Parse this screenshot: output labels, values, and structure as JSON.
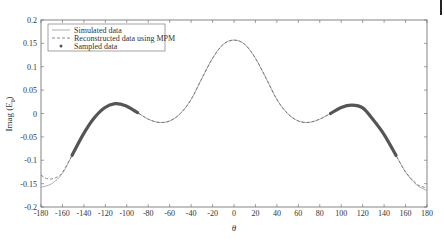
{
  "chart_data": {
    "type": "line",
    "title": "",
    "xlabel": "θ",
    "ylabel": "Imag (E_θ)",
    "xlim": [
      -180,
      180
    ],
    "ylim": [
      -0.2,
      0.2
    ],
    "xticks": [
      -180,
      -160,
      -140,
      -120,
      -100,
      -80,
      -60,
      -40,
      -20,
      0,
      20,
      40,
      60,
      80,
      100,
      120,
      140,
      160,
      180
    ],
    "yticks": [
      -0.2,
      -0.15,
      -0.1,
      -0.05,
      0,
      0.05,
      0.1,
      0.15,
      0.2
    ],
    "ytick_labels": [
      "-0.2",
      "-0.15",
      "-0.1",
      "-0.05",
      "0",
      "0.05",
      "0.1",
      "0.15",
      "0.2"
    ],
    "grid": false,
    "legend_position": "upper left",
    "series": [
      {
        "name": "Simulated data",
        "style": "solid",
        "x": [
          -180,
          -170,
          -160,
          -150,
          -140,
          -130,
          -120,
          -110,
          -100,
          -90,
          -80,
          -70,
          -60,
          -50,
          -40,
          -30,
          -20,
          -10,
          0,
          10,
          20,
          30,
          40,
          50,
          60,
          70,
          80,
          90,
          100,
          110,
          120,
          130,
          140,
          150,
          160,
          170,
          180
        ],
        "y": [
          -0.158,
          -0.15,
          -0.128,
          -0.085,
          -0.042,
          -0.008,
          0.014,
          0.022,
          0.016,
          0.002,
          -0.012,
          -0.019,
          -0.016,
          0.0,
          0.03,
          0.075,
          0.118,
          0.148,
          0.157,
          0.148,
          0.118,
          0.075,
          0.03,
          0.0,
          -0.016,
          -0.019,
          -0.012,
          0.0,
          0.013,
          0.018,
          0.012,
          -0.014,
          -0.045,
          -0.085,
          -0.125,
          -0.152,
          -0.165
        ]
      },
      {
        "name": "Reconstructed data using MPM",
        "style": "dashed",
        "x": [
          -180,
          -175,
          -170,
          -165,
          -160,
          -150,
          -140,
          -130,
          -120,
          -110,
          -100,
          -90,
          -80,
          -70,
          -60,
          -50,
          -40,
          -30,
          -20,
          -10,
          0,
          10,
          20,
          30,
          40,
          50,
          60,
          70,
          80,
          90,
          100,
          110,
          120,
          130,
          140,
          150,
          160,
          170,
          175,
          180
        ],
        "y": [
          -0.132,
          -0.139,
          -0.14,
          -0.136,
          -0.126,
          -0.085,
          -0.042,
          -0.008,
          0.014,
          0.022,
          0.016,
          0.002,
          -0.012,
          -0.019,
          -0.016,
          0.0,
          0.03,
          0.075,
          0.118,
          0.148,
          0.157,
          0.148,
          0.118,
          0.075,
          0.03,
          0.0,
          -0.016,
          -0.019,
          -0.012,
          0.0,
          0.013,
          0.018,
          0.012,
          -0.014,
          -0.045,
          -0.085,
          -0.125,
          -0.15,
          -0.156,
          -0.16
        ]
      },
      {
        "name": "Sampled data",
        "style": "markers",
        "ranges": [
          [
            -151,
            -90
          ],
          [
            90,
            151
          ]
        ]
      }
    ]
  },
  "legend": {
    "items": [
      {
        "label": "Simulated data",
        "style": "solid"
      },
      {
        "label": "Reconstructed data using MPM",
        "style": "dashed"
      },
      {
        "label": "Sampled data",
        "style": "marker"
      }
    ]
  },
  "colors": {
    "simulated": "#9a9a9a",
    "reconstructed": "#6a6a6a",
    "sampled": "#555555",
    "axis": "#666666"
  }
}
